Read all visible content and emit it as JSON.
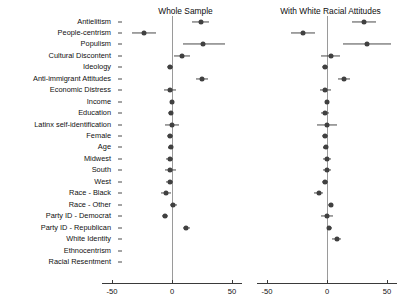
{
  "chart_data": {
    "type": "scatter",
    "plot_style": "coefficient-plot",
    "title": "",
    "xlabel": "",
    "ylabel": "",
    "xlim": [
      -62,
      62
    ],
    "xticks": [
      -50,
      0,
      50
    ],
    "xtick_labels": [
      "-50",
      "0",
      "50"
    ],
    "grid": false,
    "legend": false,
    "zero_reference_line": true,
    "categories": [
      "Antielitism",
      "People-centrism",
      "Populism",
      "Cultural Discontent",
      "Ideology",
      "Anti-immigrant Attitudes",
      "Economic Distress",
      "Income",
      "Education",
      "Latinx self-identification",
      "Female",
      "Age",
      "Midwest",
      "South",
      "West",
      "Race - Black",
      "Race - Other",
      "Party ID - Democrat",
      "Party ID - Republican",
      "White Identity",
      "Ethnocentrism",
      "Racial Resentment"
    ],
    "panels": [
      {
        "name": "whole-sample",
        "title": "Whole Sample",
        "estimates": [
          24,
          -23,
          26,
          8,
          -1.5,
          25,
          -2,
          0,
          -1,
          0,
          -2,
          -1,
          -2,
          -1.5,
          -2,
          -5,
          1,
          -5.5,
          12,
          null,
          null,
          null
        ],
        "ci_low": [
          17,
          -33,
          9,
          2,
          -4,
          20,
          -7,
          -2,
          -3,
          -6,
          -4,
          -3,
          -5,
          -6,
          -5,
          -9,
          -2,
          -8,
          9,
          null,
          null,
          null
        ],
        "ci_high": [
          31,
          -13,
          44,
          15,
          1,
          30,
          3,
          2,
          1,
          6,
          1,
          1,
          1,
          3,
          1,
          -1,
          4,
          -3,
          15,
          null,
          null,
          null
        ]
      },
      {
        "name": "with-white-racial-attitudes",
        "title": "With White Racial Attitudes",
        "estimates": [
          31,
          -20,
          33,
          3,
          -1.5,
          14,
          -1.5,
          0,
          -1.5,
          0,
          -2,
          -1,
          0,
          0,
          -1.5,
          -7,
          3,
          0,
          2,
          8,
          null,
          null
        ],
        "ci_low": [
          21,
          -30,
          13,
          -5,
          -4,
          9,
          -6,
          -2,
          -5,
          -8,
          -4,
          -3,
          -3,
          -3,
          -4,
          -11,
          1,
          -5,
          0,
          4,
          null,
          null
        ],
        "ci_high": [
          41,
          -10,
          53,
          11,
          1,
          19,
          3,
          2,
          2,
          8,
          1,
          1,
          3,
          3,
          1,
          -3,
          5,
          5,
          4,
          12,
          null,
          null
        ]
      }
    ]
  },
  "panel_titles": {
    "left": "Whole Sample",
    "right": "With White Racial Attitudes"
  },
  "axis": {
    "tick_labels": [
      "-50",
      "0",
      "50"
    ]
  }
}
